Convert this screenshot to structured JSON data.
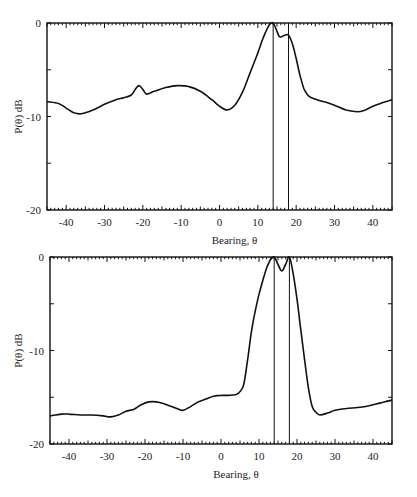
{
  "chart_data": [
    {
      "type": "line",
      "title": "",
      "xlabel": "Bearing, θ",
      "ylabel": "P(θ) dB",
      "xlim": [
        -45,
        45
      ],
      "ylim": [
        -20,
        0
      ],
      "xticks": [
        -40,
        -30,
        -20,
        -10,
        0,
        10,
        20,
        30,
        40
      ],
      "yticks": [
        0,
        -10,
        -20
      ],
      "grid": false,
      "legend": null,
      "vertical_markers": [
        14,
        18
      ],
      "series": [
        {
          "name": "spectrum",
          "x": [
            -45,
            -42,
            -40,
            -38,
            -36,
            -33,
            -30,
            -27,
            -25,
            -23,
            -22,
            -21,
            -20,
            -19,
            -17,
            -14,
            -11,
            -8,
            -5,
            -2,
            0,
            2,
            4,
            6,
            8,
            10,
            11,
            12,
            13,
            14,
            15,
            15.5,
            16,
            17,
            18,
            19,
            20,
            21,
            22,
            23,
            24,
            26,
            28,
            30,
            33,
            36,
            38,
            40,
            42,
            45
          ],
          "y": [
            -8.4,
            -8.6,
            -9.1,
            -9.6,
            -9.7,
            -9.3,
            -8.7,
            -8.2,
            -8.0,
            -7.7,
            -7.1,
            -6.7,
            -7.1,
            -7.6,
            -7.3,
            -6.9,
            -6.7,
            -6.8,
            -7.3,
            -8.2,
            -8.9,
            -9.3,
            -8.8,
            -7.4,
            -5.3,
            -3.2,
            -2.0,
            -1.0,
            -0.2,
            0.0,
            -0.9,
            -1.4,
            -1.5,
            -1.3,
            -1.3,
            -2.2,
            -3.8,
            -5.6,
            -7.0,
            -7.7,
            -8.0,
            -8.3,
            -8.5,
            -8.8,
            -9.3,
            -9.5,
            -9.3,
            -8.9,
            -8.6,
            -8.2
          ]
        }
      ]
    },
    {
      "type": "line",
      "title": "",
      "xlabel": "Bearing, θ",
      "ylabel": "P(θ) dB",
      "xlim": [
        -45,
        45
      ],
      "ylim": [
        -20,
        0
      ],
      "xticks": [
        -40,
        -30,
        -20,
        -10,
        0,
        10,
        20,
        30,
        40
      ],
      "yticks": [
        0,
        -10,
        -20
      ],
      "grid": false,
      "legend": null,
      "vertical_markers": [
        14,
        18
      ],
      "series": [
        {
          "name": "spectrum",
          "x": [
            -45,
            -42,
            -40,
            -37,
            -34,
            -31,
            -29,
            -27,
            -25,
            -23,
            -21,
            -19,
            -17,
            -15,
            -13,
            -11,
            -10,
            -8,
            -6,
            -4,
            -2,
            0,
            2,
            4,
            5,
            6,
            7,
            8,
            9,
            10,
            11,
            12,
            13,
            14,
            15,
            16,
            17,
            18,
            19,
            20,
            21,
            22,
            23,
            24,
            25,
            26,
            28,
            30,
            33,
            36,
            39,
            42,
            45
          ],
          "y": [
            -17.0,
            -16.8,
            -16.8,
            -16.9,
            -16.9,
            -17.0,
            -17.1,
            -16.9,
            -16.5,
            -16.3,
            -15.8,
            -15.5,
            -15.5,
            -15.7,
            -16.0,
            -16.3,
            -16.4,
            -16.0,
            -15.5,
            -15.2,
            -14.9,
            -14.8,
            -14.8,
            -14.7,
            -14.4,
            -13.6,
            -11.0,
            -8.0,
            -5.8,
            -4.0,
            -2.5,
            -1.2,
            -0.3,
            0.0,
            -0.8,
            -1.5,
            -0.8,
            0.0,
            -1.8,
            -4.5,
            -7.8,
            -11.0,
            -14.0,
            -16.0,
            -16.6,
            -16.9,
            -16.7,
            -16.4,
            -16.2,
            -16.1,
            -15.9,
            -15.6,
            -15.3
          ]
        }
      ]
    }
  ],
  "plots": [
    {
      "ylabel": "P(θ) dB",
      "xlabel": "Bearing, θ",
      "ytick_labels": [
        "0",
        "-10",
        "-20"
      ],
      "xtick_labels": [
        "-40",
        "-30",
        "-20",
        "-10",
        "0",
        "10",
        "20",
        "30",
        "40"
      ]
    },
    {
      "ylabel": "P(θ) dB",
      "xlabel": "Bearing, θ",
      "ytick_labels": [
        "0",
        "-10",
        "-20"
      ],
      "xtick_labels": [
        "-40",
        "-30",
        "-20",
        "-10",
        "0",
        "10",
        "20",
        "30",
        "40"
      ]
    }
  ],
  "colors": {
    "line": "#111111",
    "axis": "#111111",
    "background": "#ffffff"
  }
}
